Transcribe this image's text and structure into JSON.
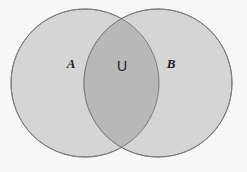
{
  "figure": {
    "type": "venn-diagram",
    "background_color": "#f7f7f7",
    "clipped_top_caption": "Sets A and B with their union",
    "circle_fill_color": "#d5d5d5",
    "overlap_fill_color": "#b8b8b8",
    "circle_stroke_color": "#7b7b7b",
    "label_color": "#1d1d1d"
  },
  "sets": {
    "left": {
      "label": "A",
      "name": "set-a",
      "center_x": 85,
      "center_y": 83,
      "radius": 74
    },
    "right": {
      "label": "B",
      "name": "set-b",
      "center_x": 158,
      "center_y": 83,
      "radius": 74
    },
    "intersection": {
      "label": "U",
      "name": "union-region",
      "center_x": 122,
      "center_y": 66
    }
  },
  "label_positions": {
    "a": {
      "x": 71,
      "y": 64
    },
    "u": {
      "x": 122,
      "y": 66
    },
    "b": {
      "x": 171,
      "y": 64
    }
  }
}
